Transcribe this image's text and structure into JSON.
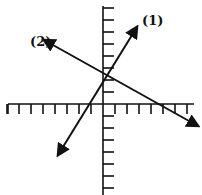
{
  "diagram": {
    "type": "coordinate-plane-lines",
    "axes": {
      "origin_px": [
        103,
        104
      ],
      "unit_px": 12,
      "x_ticks_left": 8,
      "x_ticks_right": 7,
      "y_ticks_up": 8,
      "y_ticks_down": 7
    },
    "lines": [
      {
        "id": "line-1",
        "label": "(1)",
        "from_px": [
          58,
          155
        ],
        "to_px": [
          137,
          27
        ],
        "label_pos_px": [
          142,
          25
        ],
        "color": "#111111"
      },
      {
        "id": "line-2",
        "label": "(2)",
        "from_px": [
          198,
          126
        ],
        "to_px": [
          44,
          40
        ],
        "label_pos_px": [
          30,
          46
        ],
        "color": "#111111"
      }
    ],
    "intersection_px": [
      104,
      80
    ]
  }
}
